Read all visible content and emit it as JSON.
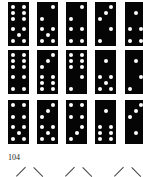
{
  "page": {
    "page_number": "104",
    "domino_color": "#050505",
    "pip_color": "#ffffff"
  },
  "dominoes": [
    {
      "row": 0,
      "col": 0,
      "top": 6,
      "bottom": 5
    },
    {
      "row": 0,
      "col": 1,
      "top": 2,
      "bottom": 5
    },
    {
      "row": 0,
      "col": 2,
      "top": 2,
      "bottom": 4
    },
    {
      "row": 0,
      "col": 3,
      "top": 3,
      "bottom": 2
    },
    {
      "row": 0,
      "col": 4,
      "top": 1,
      "bottom": 4
    },
    {
      "row": 1,
      "col": 0,
      "top": 6,
      "bottom": 4
    },
    {
      "row": 1,
      "col": 1,
      "top": 3,
      "bottom": 6
    },
    {
      "row": 1,
      "col": 2,
      "top": 6,
      "bottom": 2
    },
    {
      "row": 1,
      "col": 3,
      "top": 1,
      "bottom": 5
    },
    {
      "row": 1,
      "col": 4,
      "top": 1,
      "bottom": 2
    },
    {
      "row": 2,
      "col": 0,
      "top": 4,
      "bottom": 5
    },
    {
      "row": 2,
      "col": 1,
      "top": 3,
      "bottom": 5
    },
    {
      "row": 2,
      "col": 2,
      "top": 4,
      "bottom": 3
    },
    {
      "row": 2,
      "col": 3,
      "top": 1,
      "bottom": 6
    },
    {
      "row": 2,
      "col": 4,
      "top": 3,
      "bottom": 1
    }
  ]
}
